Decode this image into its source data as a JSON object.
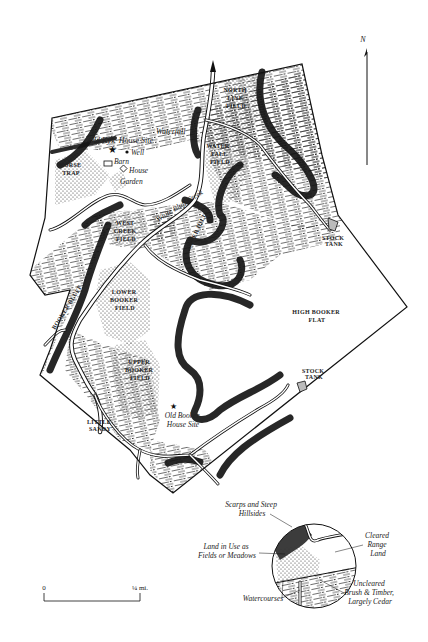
{
  "compass": {
    "label": "N"
  },
  "map_labels": {
    "north_line_field": [
      "NORTH",
      "LINE",
      "FIELD"
    ],
    "waterfall_field": [
      "WATER-",
      "FALL",
      "FIELD"
    ],
    "horse_trap": [
      "HORSE",
      "TRAP"
    ],
    "west_creek_field": [
      "WEST",
      "CREEK",
      "FIELD"
    ],
    "lower_booker_field": [
      "LOWER",
      "BOOKER",
      "FIELD"
    ],
    "upper_booker_field": [
      "UPPER",
      "BOOKER",
      "FIELD"
    ],
    "high_booker_flat": [
      "HIGH BOOKER",
      "FLAT"
    ],
    "stock_tank_1": [
      "STOCK",
      "TANK"
    ],
    "stock_tank_2": [
      "STOCK",
      "TANK"
    ],
    "little_sandy": [
      "LITTLE",
      "SANDY"
    ],
    "waterfall": "Waterfall",
    "old_kyle_house_site": "Old Kyle House Site",
    "well": "Well",
    "barn": "Barn",
    "house": "House",
    "garden": "Garden",
    "white_bluff_creek": "White Bluff Creek",
    "upper_hill": "UPPER HILL",
    "booker_bluff": "BOOKER BLUFF",
    "old_booker_house_site": [
      "Old Booker",
      "House Site"
    ]
  },
  "scale_bar": {
    "start": "0",
    "end": "¼ mi."
  },
  "legend": {
    "scarps": [
      "Scarps and Steep",
      "Hillsides"
    ],
    "fields": [
      "Land in Use as",
      "Fields or Meadows"
    ],
    "cleared": [
      "Cleared",
      "Range",
      "Land"
    ],
    "uncleared": [
      "Uncleared",
      "Brush & Timber,",
      "Largely Cedar"
    ],
    "watercourses": "Watercourses"
  }
}
